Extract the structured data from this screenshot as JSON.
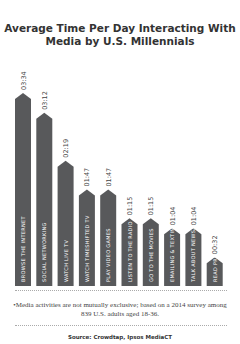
{
  "chart_data": {
    "type": "bar",
    "title": "Average Time Per Day Interacting With Media by U.S. Millennials",
    "categories": [
      "BROWSE THE INTERNET",
      "SOCIAL NETWORKING",
      "WATCH LIVE TV",
      "WATCH TIMESHIFTED TV",
      "PLAY VIDEO GAMES",
      "LISTEN TO THE RADIO",
      "GO TO THE MOVIES",
      "EMAILING & TEXTING",
      "TALK ABOUT NEWS/BRANDS",
      "READ PRINT MAGS/NEWSPAPERS"
    ],
    "value_labels": [
      "03:34",
      "03:12",
      "02:19",
      "01:47",
      "01:47",
      "01:15",
      "01:15",
      "01:04",
      "01:04",
      "00:32"
    ],
    "values_minutes": [
      214,
      192,
      139,
      107,
      107,
      75,
      75,
      64,
      64,
      32
    ],
    "xlabel": "",
    "ylabel": "",
    "bar_color": "#58595b",
    "grid": false
  },
  "footnote": "•Media activities are not mutually exclusive; based on a 2014 survey among 839 U.S. adults aged 18-36.",
  "source": "Source: Crowdtap, Ipsos MediaCT"
}
